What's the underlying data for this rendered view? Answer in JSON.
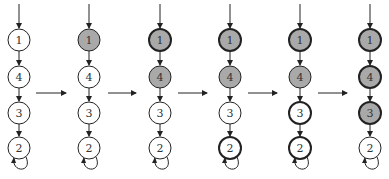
{
  "diagram": {
    "node_order": [
      "1",
      "4",
      "3",
      "2"
    ],
    "node_y": [
      40,
      77,
      113,
      148
    ],
    "node_radius": 11,
    "colors": {
      "stroke": "#222222",
      "filled": "#a9a9a9",
      "empty": "#ffffff"
    },
    "columns": [
      {
        "x": 19,
        "filled": [],
        "thick": []
      },
      {
        "x": 89,
        "filled": [
          "1"
        ],
        "thick": []
      },
      {
        "x": 160,
        "filled": [
          "1",
          "4"
        ],
        "thick": [
          "1"
        ]
      },
      {
        "x": 230,
        "filled": [
          "1",
          "4"
        ],
        "thick": [
          "1",
          "2"
        ]
      },
      {
        "x": 300,
        "filled": [
          "1",
          "4"
        ],
        "thick": [
          "1",
          "3",
          "2"
        ]
      },
      {
        "x": 370,
        "filled": [
          "1",
          "4",
          "3"
        ],
        "thick": [
          "1",
          "4",
          "3"
        ]
      }
    ],
    "transitions_y": 93,
    "transitions": [
      {
        "from_x": 36,
        "to_x": 66
      },
      {
        "from_x": 108,
        "to_x": 136
      },
      {
        "from_x": 178,
        "to_x": 207
      },
      {
        "from_x": 248,
        "to_x": 277
      },
      {
        "from_x": 318,
        "to_x": 347
      }
    ]
  }
}
